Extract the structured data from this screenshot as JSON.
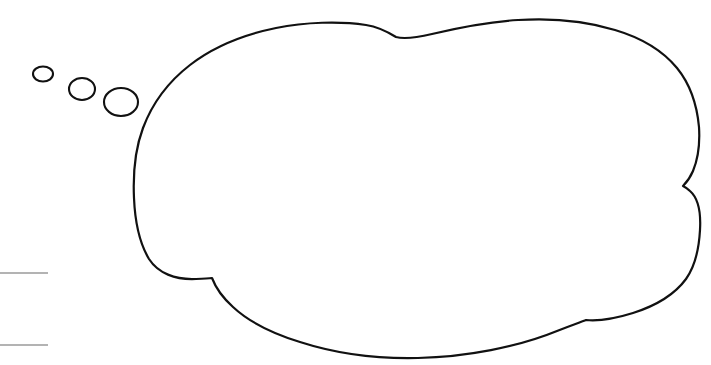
{
  "document": {
    "title": "Thought Bubble",
    "background_color": "#ffffff",
    "width": 711,
    "height": 365,
    "ink_color": "#111111",
    "rule_color": "#b3b3b3"
  },
  "artwork": {
    "kind": "line-drawing",
    "subject": "empty hand-drawn thought bubble with trailing bubbles",
    "style": "black ink outline on white, no fill, no text inside",
    "bubble": {
      "label": "main thought bubble",
      "outline_color": "#111111",
      "fill_color": "#ffffff",
      "stroke_width": 2.2,
      "bounds": {
        "left": 133,
        "top": 22,
        "right": 700,
        "bottom": 359
      },
      "cusps": [
        {
          "name": "top-center-notch",
          "x": 396,
          "y": 37
        },
        {
          "name": "right-middle-notch",
          "x": 683,
          "y": 186
        },
        {
          "name": "bottom-left-notch",
          "x": 212,
          "y": 278
        },
        {
          "name": "bottom-right-notch",
          "x": 586,
          "y": 320
        }
      ]
    },
    "trail_bubbles": [
      {
        "label": "trail-bubble-small",
        "cx": 43,
        "cy": 74,
        "rx": 10,
        "ry": 7.5
      },
      {
        "label": "trail-bubble-medium",
        "cx": 82,
        "cy": 89,
        "rx": 13,
        "ry": 11
      },
      {
        "label": "trail-bubble-large",
        "cx": 121,
        "cy": 102,
        "rx": 17,
        "ry": 14
      }
    ],
    "margin_rules": [
      {
        "label": "upper-margin-rule",
        "x1": 0,
        "y1": 273,
        "x2": 48,
        "y2": 273
      },
      {
        "label": "lower-margin-rule",
        "x1": 0,
        "y1": 345,
        "x2": 48,
        "y2": 345
      }
    ]
  },
  "bubble_caption": {
    "text": ""
  }
}
